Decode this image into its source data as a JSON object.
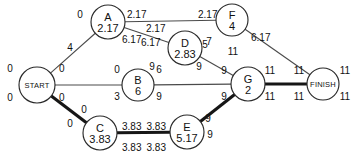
{
  "diagram": {
    "type": "pert-cpm-network",
    "title": "",
    "nodes": [
      {
        "id": "START",
        "label": "START",
        "duration": "",
        "cx": 37,
        "cy": 85,
        "r": 18,
        "terminal": true
      },
      {
        "id": "A",
        "label": "A",
        "duration": "2.17",
        "cx": 108,
        "cy": 22,
        "r": 17,
        "terminal": false
      },
      {
        "id": "F",
        "label": "F",
        "duration": "4",
        "cx": 232,
        "cy": 20,
        "r": 16,
        "terminal": false
      },
      {
        "id": "D",
        "label": "D",
        "duration": "2.83",
        "cx": 185,
        "cy": 48,
        "r": 17,
        "terminal": false
      },
      {
        "id": "B",
        "label": "B",
        "duration": "6",
        "cx": 138,
        "cy": 85,
        "r": 16,
        "terminal": false
      },
      {
        "id": "G",
        "label": "G",
        "duration": "2",
        "cx": 248,
        "cy": 84,
        "r": 17,
        "terminal": false
      },
      {
        "id": "C",
        "label": "C",
        "duration": "3.83",
        "cx": 100,
        "cy": 133,
        "r": 17,
        "terminal": false
      },
      {
        "id": "E",
        "label": "E",
        "duration": "5.17",
        "cx": 187,
        "cy": 132,
        "r": 17,
        "terminal": false
      },
      {
        "id": "FINISH",
        "label": "FINISH",
        "duration": "",
        "cx": 323,
        "cy": 84,
        "r": 16,
        "terminal": true
      }
    ],
    "edges": [
      {
        "from": "START",
        "to": "A",
        "critical": false
      },
      {
        "from": "START",
        "to": "B",
        "critical": false
      },
      {
        "from": "START",
        "to": "C",
        "critical": true
      },
      {
        "from": "A",
        "to": "F",
        "critical": false
      },
      {
        "from": "A",
        "to": "D",
        "critical": false
      },
      {
        "from": "F",
        "to": "FINISH",
        "critical": false
      },
      {
        "from": "D",
        "to": "G",
        "critical": false
      },
      {
        "from": "B",
        "to": "G",
        "critical": false
      },
      {
        "from": "C",
        "to": "E",
        "critical": true
      },
      {
        "from": "E",
        "to": "G",
        "critical": true
      },
      {
        "from": "G",
        "to": "FINISH",
        "critical": true
      }
    ],
    "annotations": [
      {
        "name": "start-es",
        "text": "0",
        "x": 10,
        "y": 72,
        "align": "mid"
      },
      {
        "name": "start-ls",
        "text": "0",
        "x": 10,
        "y": 101,
        "align": "mid"
      },
      {
        "name": "start-ef",
        "text": "0",
        "x": 59,
        "y": 72,
        "align": "start"
      },
      {
        "name": "start-lf",
        "text": "0",
        "x": 59,
        "y": 101,
        "align": "start"
      },
      {
        "name": "a-es",
        "text": "0",
        "x": 80,
        "y": 18,
        "align": "mid"
      },
      {
        "name": "a-ef",
        "text": "2.17",
        "text_x": 127,
        "x": 127,
        "y": 18,
        "align": "start"
      },
      {
        "name": "a-lf",
        "text": "6.17",
        "x": 122,
        "y": 43,
        "align": "start"
      },
      {
        "name": "start-a-edge",
        "text": "4",
        "x": 70,
        "y": 51,
        "align": "mid"
      },
      {
        "name": "f-es",
        "text": "2.17",
        "x": 198,
        "y": 18,
        "align": "start"
      },
      {
        "name": "f-ls",
        "text": "7",
        "x": 209,
        "y": 45,
        "align": "mid"
      },
      {
        "name": "f-ef",
        "text": "6.17",
        "x": 251,
        "y": 41,
        "align": "start"
      },
      {
        "name": "f-lf",
        "text": "11",
        "x": 233,
        "y": 55,
        "align": "mid"
      },
      {
        "name": "d-es",
        "text": "2.17",
        "x": 146,
        "y": 32,
        "align": "start"
      },
      {
        "name": "d-ls",
        "text": "6.17",
        "x": 141,
        "y": 46,
        "align": "start"
      },
      {
        "name": "d-ef",
        "text": "5",
        "x": 205,
        "y": 48,
        "align": "mid"
      },
      {
        "name": "d-lf",
        "text": "9",
        "x": 199,
        "y": 70,
        "align": "mid"
      },
      {
        "name": "b-es",
        "text": "0",
        "x": 117,
        "y": 73,
        "align": "mid"
      },
      {
        "name": "b-ls",
        "text": "3",
        "x": 117,
        "y": 100,
        "align": "mid"
      },
      {
        "name": "b-ef",
        "text": "6",
        "x": 159,
        "y": 73,
        "align": "mid"
      },
      {
        "name": "b-lf",
        "text": "9",
        "x": 159,
        "y": 100,
        "align": "mid"
      },
      {
        "name": "g-es",
        "text": "9",
        "x": 224,
        "y": 74,
        "align": "mid"
      },
      {
        "name": "g-ls",
        "text": "9",
        "x": 224,
        "y": 100,
        "align": "mid"
      },
      {
        "name": "g-ef",
        "text": "11",
        "x": 270,
        "y": 74,
        "align": "mid"
      },
      {
        "name": "g-lf",
        "text": "11",
        "x": 270,
        "y": 100,
        "align": "mid"
      },
      {
        "name": "finish-es",
        "text": "11",
        "x": 299,
        "y": 74,
        "align": "mid"
      },
      {
        "name": "finish-ls",
        "text": "11",
        "x": 299,
        "y": 100,
        "align": "mid"
      },
      {
        "name": "finish-ef",
        "text": "11",
        "x": 345,
        "y": 74,
        "align": "mid"
      },
      {
        "name": "finish-lf",
        "text": "11",
        "x": 345,
        "y": 100,
        "align": "mid"
      },
      {
        "name": "c-es",
        "text": "0",
        "x": 84,
        "y": 113,
        "align": "mid"
      },
      {
        "name": "c-ls",
        "text": "0",
        "x": 70,
        "y": 127,
        "align": "mid"
      },
      {
        "name": "c-ef",
        "text": "3.83",
        "x": 122,
        "y": 130,
        "align": "start"
      },
      {
        "name": "c-lf",
        "text": "3.83",
        "x": 122,
        "y": 151,
        "align": "start"
      },
      {
        "name": "e-es",
        "text": "3.83",
        "x": 166,
        "y": 130,
        "align": "end"
      },
      {
        "name": "e-ls",
        "text": "3.83",
        "x": 166,
        "y": 151,
        "align": "end"
      },
      {
        "name": "e-ef",
        "text": "9",
        "x": 208,
        "y": 122,
        "align": "mid"
      },
      {
        "name": "e-lf",
        "text": "9",
        "x": 210,
        "y": 138,
        "align": "mid"
      },
      {
        "name": "eg-9",
        "text": "9",
        "x": 152,
        "y": 70,
        "align": "mid"
      }
    ]
  }
}
